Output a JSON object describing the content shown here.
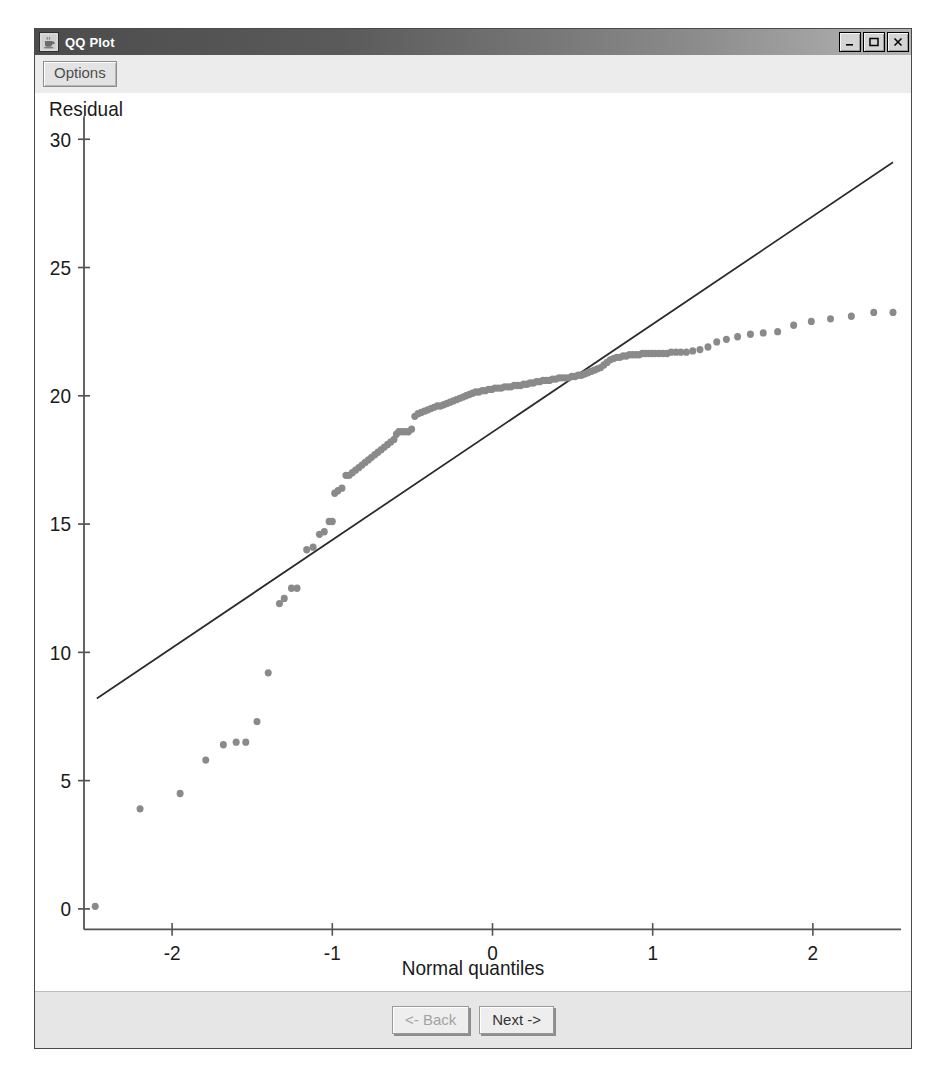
{
  "window": {
    "title": "QQ Plot",
    "icon": "java-coffee-cup-icon",
    "controls": {
      "minimize_label": "_",
      "maximize_label": "□",
      "close_label": "×"
    }
  },
  "toolbar": {
    "options_label": "Options"
  },
  "footer": {
    "back_label": "<- Back",
    "next_label": "Next ->",
    "back_disabled": true
  },
  "colors": {
    "point": "#8a8a8a",
    "line": "#2a2a2a",
    "axis": "#545454",
    "text": "#1a1a1a",
    "window_bg": "#ececec",
    "plot_bg": "#ffffff",
    "titlebar_start": "#4c4c4c",
    "titlebar_end": "#b4b4b4"
  },
  "chart_data": {
    "type": "scatter",
    "title": "",
    "xlabel": "Normal quantiles",
    "ylabel": "Residual",
    "xlim": [
      -2.55,
      2.55
    ],
    "ylim": [
      -0.8,
      30.9
    ],
    "xticks": [
      -2,
      -1,
      0,
      1,
      2
    ],
    "xticklabels": [
      "-2",
      "-1",
      "0",
      "1",
      "2"
    ],
    "yticks": [
      0,
      5,
      10,
      15,
      20,
      25,
      30
    ],
    "yticklabels": [
      "0",
      "5",
      "10",
      "15",
      "20",
      "25",
      "30"
    ],
    "grid": false,
    "legend": null,
    "reference_line": {
      "name": "normal reference line",
      "x": [
        -2.47,
        2.5
      ],
      "y": [
        8.2,
        29.1
      ]
    },
    "series": [
      {
        "name": "Residual quantiles",
        "marker": "filled-circle",
        "marker_size_px": 7,
        "color": "#8a8a8a",
        "points": [
          [
            -2.48,
            0.1
          ],
          [
            -2.2,
            3.9
          ],
          [
            -1.95,
            4.5
          ],
          [
            -1.79,
            5.8
          ],
          [
            -1.68,
            6.4
          ],
          [
            -1.6,
            6.5
          ],
          [
            -1.54,
            6.5
          ],
          [
            -1.47,
            7.3
          ],
          [
            -1.4,
            9.2
          ],
          [
            -1.33,
            11.9
          ],
          [
            -1.3,
            12.1
          ],
          [
            -1.255,
            12.5
          ],
          [
            -1.22,
            12.5
          ],
          [
            -1.16,
            14.0
          ],
          [
            -1.12,
            14.1
          ],
          [
            -1.08,
            14.6
          ],
          [
            -1.05,
            14.7
          ],
          [
            -1.02,
            15.1
          ],
          [
            -1.0,
            15.1
          ],
          [
            -0.985,
            16.2
          ],
          [
            -0.965,
            16.3
          ],
          [
            -0.94,
            16.4
          ],
          [
            -0.915,
            16.9
          ],
          [
            -0.895,
            16.9
          ],
          [
            -0.875,
            17.0
          ],
          [
            -0.855,
            17.1
          ],
          [
            -0.835,
            17.2
          ],
          [
            -0.815,
            17.3
          ],
          [
            -0.795,
            17.4
          ],
          [
            -0.775,
            17.5
          ],
          [
            -0.755,
            17.6
          ],
          [
            -0.735,
            17.7
          ],
          [
            -0.715,
            17.8
          ],
          [
            -0.695,
            17.9
          ],
          [
            -0.675,
            18.0
          ],
          [
            -0.655,
            18.1
          ],
          [
            -0.635,
            18.2
          ],
          [
            -0.615,
            18.3
          ],
          [
            -0.6,
            18.5
          ],
          [
            -0.585,
            18.6
          ],
          [
            -0.565,
            18.6
          ],
          [
            -0.545,
            18.6
          ],
          [
            -0.525,
            18.6
          ],
          [
            -0.505,
            18.7
          ],
          [
            -0.485,
            19.2
          ],
          [
            -0.465,
            19.3
          ],
          [
            -0.445,
            19.35
          ],
          [
            -0.425,
            19.4
          ],
          [
            -0.405,
            19.45
          ],
          [
            -0.385,
            19.5
          ],
          [
            -0.365,
            19.55
          ],
          [
            -0.345,
            19.6
          ],
          [
            -0.325,
            19.6
          ],
          [
            -0.305,
            19.65
          ],
          [
            -0.285,
            19.7
          ],
          [
            -0.265,
            19.75
          ],
          [
            -0.245,
            19.8
          ],
          [
            -0.225,
            19.85
          ],
          [
            -0.205,
            19.9
          ],
          [
            -0.185,
            19.95
          ],
          [
            -0.165,
            20.0
          ],
          [
            -0.145,
            20.05
          ],
          [
            -0.125,
            20.1
          ],
          [
            -0.105,
            20.15
          ],
          [
            -0.085,
            20.15
          ],
          [
            -0.065,
            20.2
          ],
          [
            -0.045,
            20.2
          ],
          [
            -0.025,
            20.25
          ],
          [
            -0.005,
            20.25
          ],
          [
            0.015,
            20.3
          ],
          [
            0.035,
            20.3
          ],
          [
            0.055,
            20.3
          ],
          [
            0.075,
            20.35
          ],
          [
            0.095,
            20.35
          ],
          [
            0.115,
            20.35
          ],
          [
            0.135,
            20.4
          ],
          [
            0.155,
            20.4
          ],
          [
            0.175,
            20.4
          ],
          [
            0.195,
            20.45
          ],
          [
            0.215,
            20.45
          ],
          [
            0.235,
            20.5
          ],
          [
            0.255,
            20.5
          ],
          [
            0.275,
            20.55
          ],
          [
            0.295,
            20.55
          ],
          [
            0.315,
            20.6
          ],
          [
            0.335,
            20.6
          ],
          [
            0.355,
            20.6
          ],
          [
            0.375,
            20.65
          ],
          [
            0.395,
            20.65
          ],
          [
            0.415,
            20.7
          ],
          [
            0.435,
            20.7
          ],
          [
            0.455,
            20.7
          ],
          [
            0.475,
            20.7
          ],
          [
            0.495,
            20.75
          ],
          [
            0.515,
            20.75
          ],
          [
            0.535,
            20.8
          ],
          [
            0.555,
            20.8
          ],
          [
            0.575,
            20.85
          ],
          [
            0.595,
            20.9
          ],
          [
            0.615,
            20.95
          ],
          [
            0.635,
            21.0
          ],
          [
            0.655,
            21.05
          ],
          [
            0.675,
            21.1
          ],
          [
            0.695,
            21.2
          ],
          [
            0.715,
            21.3
          ],
          [
            0.735,
            21.4
          ],
          [
            0.755,
            21.45
          ],
          [
            0.775,
            21.5
          ],
          [
            0.795,
            21.5
          ],
          [
            0.815,
            21.55
          ],
          [
            0.835,
            21.55
          ],
          [
            0.855,
            21.6
          ],
          [
            0.875,
            21.6
          ],
          [
            0.895,
            21.6
          ],
          [
            0.915,
            21.6
          ],
          [
            0.935,
            21.65
          ],
          [
            0.955,
            21.65
          ],
          [
            0.975,
            21.65
          ],
          [
            0.995,
            21.65
          ],
          [
            1.015,
            21.65
          ],
          [
            1.04,
            21.65
          ],
          [
            1.065,
            21.65
          ],
          [
            1.09,
            21.65
          ],
          [
            1.115,
            21.7
          ],
          [
            1.145,
            21.7
          ],
          [
            1.175,
            21.7
          ],
          [
            1.21,
            21.7
          ],
          [
            1.25,
            21.75
          ],
          [
            1.295,
            21.8
          ],
          [
            1.345,
            21.9
          ],
          [
            1.4,
            22.1
          ],
          [
            1.46,
            22.2
          ],
          [
            1.53,
            22.3
          ],
          [
            1.61,
            22.4
          ],
          [
            1.69,
            22.45
          ],
          [
            1.78,
            22.5
          ],
          [
            1.88,
            22.75
          ],
          [
            1.99,
            22.9
          ],
          [
            2.11,
            23.0
          ],
          [
            2.24,
            23.1
          ],
          [
            2.38,
            23.25
          ],
          [
            2.5,
            23.25
          ]
        ]
      }
    ]
  }
}
